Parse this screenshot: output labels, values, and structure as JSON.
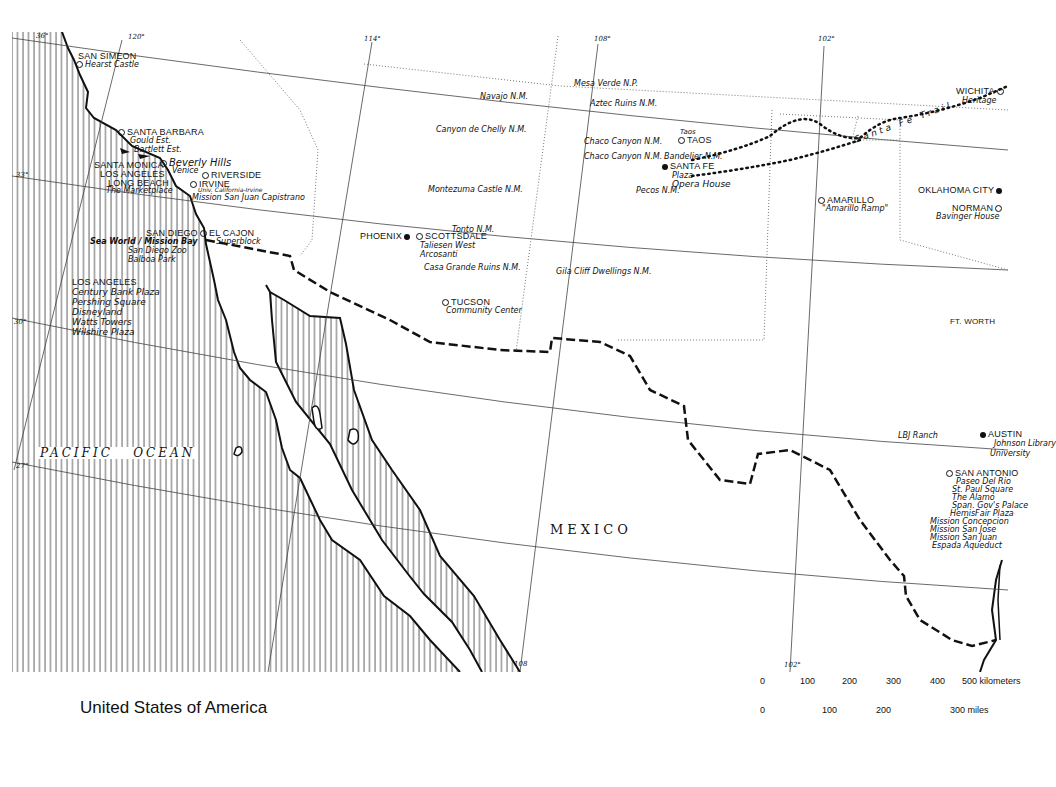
{
  "title": "United States of America",
  "graticule": {
    "longitudes": [
      "120°",
      "114°",
      "108°",
      "102°"
    ],
    "latitudes": [
      "36°",
      "33°",
      "30°",
      "27°"
    ],
    "bottom_ticks": [
      "108",
      "102°"
    ]
  },
  "water_labels": [
    "PACIFIC",
    "OCEAN"
  ],
  "country_labels": [
    "MEXICO"
  ],
  "trail_label": "Santa Fe Trail",
  "cities": [
    {
      "name": "SAN SIMEON",
      "symbol": "ring",
      "sites": [
        "Hearst Castle"
      ]
    },
    {
      "name": "SANTA BARBARA",
      "symbol": "ring",
      "sites": [
        "Gould Est.",
        "Bartlett Est."
      ]
    },
    {
      "name": "SANTA MONICA",
      "symbol": "ring",
      "sites": []
    },
    {
      "name": "Beverly Hills",
      "symbol": "ring",
      "sites": [
        "Venice"
      ]
    },
    {
      "name": "LOS ANGELES",
      "symbol": "ring",
      "sites": []
    },
    {
      "name": "LONG BEACH",
      "symbol": "ring",
      "sites": [
        "The Marketplace"
      ]
    },
    {
      "name": "RIVERSIDE",
      "symbol": "ring",
      "sites": []
    },
    {
      "name": "IRVINE",
      "symbol": "ring",
      "sites": [
        "Univ. California-Irvine",
        "Mission San Juan Capistrano"
      ]
    },
    {
      "name": "SAN DIEGO",
      "symbol": "ring",
      "sites": [
        "Sea World / Mission Bay",
        "San Diego Zoo",
        "Balboa Park"
      ]
    },
    {
      "name": "EL CAJON",
      "symbol": "ring",
      "sites": [
        "Superblock"
      ]
    },
    {
      "name": "PHOENIX",
      "symbol": "dot",
      "sites": []
    },
    {
      "name": "SCOTTSDALE",
      "symbol": "ring",
      "sites": [
        "Taliesen West",
        "Arcosanti"
      ]
    },
    {
      "name": "TUCSON",
      "symbol": "ring",
      "sites": [
        "Community Center"
      ]
    },
    {
      "name": "SANTA FE",
      "symbol": "dot",
      "sites": [
        "Plaza",
        "Opera House"
      ]
    },
    {
      "name": "TAOS",
      "symbol": "ring",
      "sites": [
        "Taos"
      ]
    },
    {
      "name": "AMARILLO",
      "symbol": "ring",
      "sites": [
        "\"Amarillo Ramp\""
      ]
    },
    {
      "name": "WICHITA",
      "symbol": "ring",
      "sites": [
        "Heritage"
      ]
    },
    {
      "name": "OKLAHOMA CITY",
      "symbol": "dot",
      "sites": []
    },
    {
      "name": "NORMAN",
      "symbol": "ring",
      "sites": [
        "Bavinger House"
      ]
    },
    {
      "name": "FT. WORTH",
      "symbol": "ring",
      "sites": []
    },
    {
      "name": "AUSTIN",
      "symbol": "dot",
      "sites": [
        "Johnson Library",
        "University"
      ]
    },
    {
      "name": "SAN ANTONIO",
      "symbol": "ring",
      "sites": [
        "Paseo Del Rio",
        "St. Paul Square",
        "The Alamo",
        "Span. Gov's Palace",
        "HemisFair Plaza",
        "Mission Concepcion",
        "Mission San Jose",
        "Mission San Juan",
        "Espada Aqueduct"
      ]
    }
  ],
  "la_sites_block": {
    "heading": "LOS ANGELES",
    "sites": [
      "Century Bank Plaza",
      "Pershing Square",
      "Disneyland",
      "Watts Towers",
      "Wilshire Plaza"
    ]
  },
  "monuments": [
    "Mesa Verde N.P.",
    "Navajo N.M.",
    "Aztec Ruins N.M.",
    "Canyon de Chelly N.M.",
    "Chaco Canyon N.M.",
    "Chaco Canyon N.M.",
    "Bandelier N.M.",
    "Pecos N.M.",
    "Montezuma Castle N.M.",
    "Tonto N.M.",
    "Casa Grande Ruins N.M.",
    "Gila Cliff Dwellings N.M.",
    "LBJ Ranch"
  ],
  "scale_bar": {
    "km_ticks": [
      "0",
      "100",
      "200",
      "300",
      "400",
      "500"
    ],
    "km_unit": "kilometers",
    "mile_ticks": [
      "0",
      "100",
      "200",
      "300"
    ],
    "mile_unit": "miles"
  },
  "colors": {
    "ink": "#111111",
    "paper": "#ffffff",
    "grid": "#444444"
  }
}
